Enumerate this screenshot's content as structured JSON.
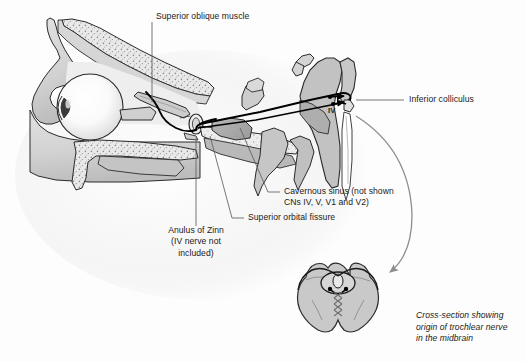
{
  "figure": {
    "domain": "anatomical-diagram",
    "view": "sagittal section of orbit, cavernous sinus and brainstem with midbrain cross-section inset"
  },
  "labels": {
    "superior_oblique_muscle": "Superior oblique muscle",
    "inferior_colliculus": "Inferior colliculus",
    "nerve_marker": "IV",
    "cavernous_sinus_line1": "Cavernous sinus (not shown",
    "cavernous_sinus_line2": "CNs IV, V, V1 and V2)",
    "superior_orbital_fissure": "Superior orbital fissure",
    "anulus_line1": "Anulus of Zinn",
    "anulus_line2": "(IV nerve not",
    "anulus_line3": "included)",
    "caption_line1": "Cross-section showing",
    "caption_line2": "origin of trochlear nerve",
    "caption_line3": "in the midbrain"
  },
  "colors": {
    "background": "#fdfdfd",
    "outline": "#2b2b2b",
    "soft_tissue_light": "#dcdcdc",
    "soft_tissue_mid": "#c9c9c9",
    "soft_tissue_dark": "#a8a8a8",
    "bone_fill": "#e8e8e8",
    "bone_stipple": "#9a9a9a",
    "eyeball_highlight": "#ffffff",
    "eyeball_shade": "#dddddd",
    "lens_dark": "#3a3a3a",
    "nerve_black": "#000000",
    "leader_line": "#5e5e5e",
    "arrow_gray": "#8d8d8d",
    "text": "#1a1a1a"
  },
  "structures": [
    {
      "name": "frontal-bone",
      "kind": "bone-stippled"
    },
    {
      "name": "orbital-roof",
      "kind": "bone-stippled"
    },
    {
      "name": "eyeball",
      "kind": "globe"
    },
    {
      "name": "lens",
      "kind": "globe-detail"
    },
    {
      "name": "optic-nerve-stump",
      "kind": "soft-tissue"
    },
    {
      "name": "superior-oblique-muscle",
      "kind": "muscle"
    },
    {
      "name": "anulus-of-zinn",
      "kind": "ring"
    },
    {
      "name": "maxilla",
      "kind": "bone-stippled"
    },
    {
      "name": "sphenoid-body",
      "kind": "bone-stippled"
    },
    {
      "name": "cavernous-sinus-region",
      "kind": "soft-tissue"
    },
    {
      "name": "brainstem",
      "kind": "soft-tissue"
    },
    {
      "name": "inferior-colliculus",
      "kind": "soft-tissue"
    },
    {
      "name": "trochlear-nerve-path",
      "kind": "nerve"
    },
    {
      "name": "midbrain-cross-section",
      "kind": "inset"
    },
    {
      "name": "trochlear-decussation",
      "kind": "nerve-crossing"
    }
  ],
  "annotations": {
    "curved_arrow": "brainstem-to-cross-section-pointer",
    "leader_lines": 5
  }
}
